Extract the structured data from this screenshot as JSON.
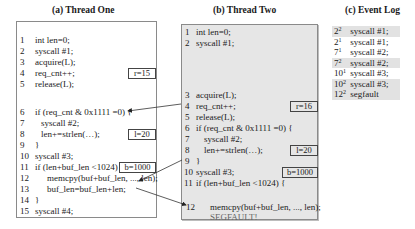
{
  "panels": {
    "thread_one": {
      "title": "(a) Thread One",
      "lines": [
        {
          "n": "1",
          "code": "int len=0;"
        },
        {
          "n": "2",
          "code": "syscall #1;"
        },
        {
          "n": "3",
          "code": "acquire(L);"
        },
        {
          "n": "4",
          "code": "req_cnt++;"
        },
        {
          "n": "5",
          "code": "release(L);"
        },
        {
          "n": "6",
          "code": "if (req_cnt & 0x1111 =0) {"
        },
        {
          "n": "7",
          "code": "syscall #2;"
        },
        {
          "n": "8",
          "code": "len+=strlen(…);"
        },
        {
          "n": "9",
          "code": "}"
        },
        {
          "n": "10",
          "code": "syscall #3;"
        },
        {
          "n": "11",
          "code": "if (len+buf_len <1024) {"
        },
        {
          "n": "12",
          "code": "memcpy(buf+buf_len, ..., len);"
        },
        {
          "n": "13",
          "code": "buf_len=buf_len+len;"
        },
        {
          "n": "14",
          "code": "}"
        },
        {
          "n": "15",
          "code": "syscall #4;"
        }
      ],
      "values": {
        "r": "r=15",
        "l": "l=20",
        "b": "b=1000"
      }
    },
    "thread_two": {
      "title": "(b) Thread Two",
      "lines": [
        {
          "n": "1",
          "code": "int len=0;"
        },
        {
          "n": "2",
          "code": "syscall #1;"
        },
        {
          "n": "3",
          "code": "acquire(L);"
        },
        {
          "n": "4",
          "code": "req_cnt++;"
        },
        {
          "n": "5",
          "code": "release(L);"
        },
        {
          "n": "6",
          "code": "if (req_cnt & 0x1111 =0) {"
        },
        {
          "n": "7",
          "code": "syscall #2;"
        },
        {
          "n": "8",
          "code": "len+=strlen(…);"
        },
        {
          "n": "9",
          "code": "}"
        },
        {
          "n": "10",
          "code": "syscall #3;"
        },
        {
          "n": "11",
          "code": "if (len+buf_len <1024) {"
        },
        {
          "n": "12",
          "code": "memcpy(buf+buf_len, ..., len);"
        }
      ],
      "segfault": "SEGFAULT!",
      "values": {
        "r": "r=16",
        "l": "l=20",
        "b": "b=1000"
      }
    },
    "event_log": {
      "title": "(c) Event Log",
      "rows": [
        {
          "line": "2",
          "thread": "2",
          "event": "syscall #1;",
          "shaded": true
        },
        {
          "line": "2",
          "thread": "1",
          "event": "syscall #1;",
          "shaded": false
        },
        {
          "line": "7",
          "thread": "1",
          "event": "syscall #2;",
          "shaded": false
        },
        {
          "line": "7",
          "thread": "2",
          "event": "syscall #2;",
          "shaded": true
        },
        {
          "line": "10",
          "thread": "1",
          "event": "syscall #3;",
          "shaded": false
        },
        {
          "line": "10",
          "thread": "2",
          "event": "syscall #3;",
          "shaded": true
        },
        {
          "line": "12",
          "thread": "2",
          "event": "segfault",
          "shaded": true
        }
      ]
    }
  },
  "arrows": [
    {
      "from": "thread_two.line4",
      "to": "thread_one.line6"
    },
    {
      "from": "thread_two.line11",
      "to": "thread_one.line12"
    },
    {
      "from": "thread_one.line13",
      "to": "thread_two.line12"
    }
  ]
}
